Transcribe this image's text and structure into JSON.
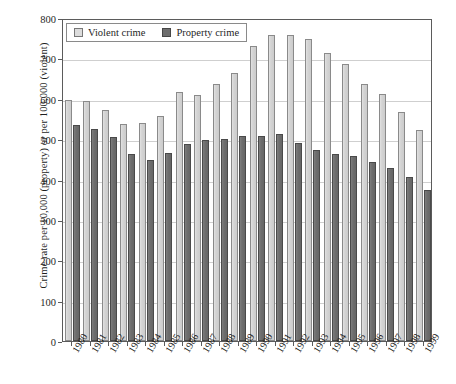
{
  "chart_data": {
    "type": "bar",
    "title": "",
    "subtitle": "",
    "xlabel": "",
    "ylabel": "Crime rate per 10,000 (property) or per 100,000 (violent)",
    "ylim": [
      0,
      800
    ],
    "ytick_labels": [
      "0",
      "100",
      "200",
      "300",
      "400",
      "500",
      "600",
      "700",
      "800"
    ],
    "ytick_values": [
      0,
      100,
      200,
      300,
      400,
      500,
      600,
      700,
      800
    ],
    "grid": true,
    "legend_position": "top-left",
    "categories": [
      "1980",
      "1981",
      "1982",
      "1983",
      "1984",
      "1985",
      "1986",
      "1987",
      "1988",
      "1989",
      "1990",
      "1991",
      "1992",
      "1993",
      "1994",
      "1995",
      "1996",
      "1997",
      "1998",
      "1999"
    ],
    "series": [
      {
        "name": "Violent crime",
        "color": "#d9d9d9",
        "values": [
          596,
          594,
          571,
          537,
          539,
          557,
          617,
          610,
          637,
          663,
          730,
          758,
          757,
          747,
          714,
          685,
          637,
          611,
          567,
          523
        ]
      },
      {
        "name": "Property crime",
        "color": "#6e6e6e",
        "values": [
          535,
          525,
          505,
          464,
          449,
          466,
          488,
          499,
          501,
          507,
          508,
          513,
          491,
          473,
          463,
          459,
          444,
          429,
          405,
          375
        ]
      }
    ]
  },
  "legend": {
    "items": [
      {
        "label": "Violent crime",
        "swatch": "violent-swatch"
      },
      {
        "label": "Property crime",
        "swatch": "property-swatch"
      }
    ]
  }
}
